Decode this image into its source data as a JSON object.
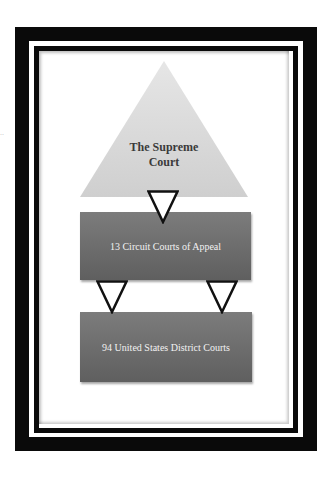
{
  "diagram": {
    "levels": [
      {
        "label_line1": "The Supreme",
        "label_line2": "Court",
        "shape": "triangle",
        "fill": "#d8d8d8"
      },
      {
        "label": "13 Circuit Courts of Appeal",
        "shape": "rectangle",
        "fill": "#6e6e6e"
      },
      {
        "label": "94 United States District Courts",
        "shape": "rectangle",
        "fill": "#6e6e6e"
      }
    ],
    "connectors": [
      {
        "from": "The Supreme Court",
        "to": "13 Circuit Courts of Appeal",
        "icon": "down-triangle-arrow"
      },
      {
        "from": "13 Circuit Courts of Appeal",
        "to": "94 United States District Courts",
        "icon": "down-triangle-arrow"
      },
      {
        "from": "13 Circuit Courts of Appeal",
        "to": "94 United States District Courts",
        "icon": "down-triangle-arrow"
      }
    ],
    "frame": {
      "color": "#0a0a0a",
      "background": "#ffffff"
    }
  }
}
